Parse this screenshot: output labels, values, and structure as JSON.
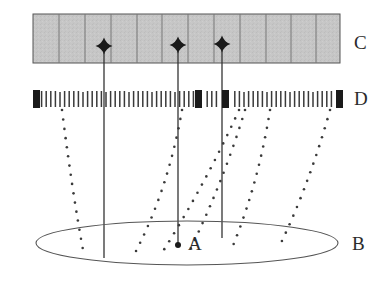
{
  "figure": {
    "background_color": "#ffffff",
    "width": 390,
    "height": 302
  },
  "labels": {
    "C": "C",
    "D": "D",
    "B": "B",
    "A": "A"
  },
  "chart_data": {
    "type": "diagram",
    "title": "",
    "xlabel": "",
    "ylabel": "",
    "elements": [
      {
        "id": "C",
        "name": "segmented-gray-bar",
        "label": "C",
        "description": "Horizontal gray segmented bar (detector / focal plane array) divided into cells by vertical rules",
        "x": 33,
        "y": 14,
        "width": 307,
        "height": 49,
        "fill_color": "#c4c4c4",
        "stroke_color": "#555555",
        "cell_count": 12,
        "cell_boundaries_x": [
          33,
          59,
          85,
          111,
          137,
          162,
          188,
          214,
          240,
          266,
          291,
          316,
          340
        ]
      },
      {
        "id": "C-stars",
        "name": "star-markers",
        "description": "Four-pointed star markers on bar C (sources imaged on the array)",
        "marker_color": "#1a1a1a",
        "points": [
          {
            "x": 104,
            "y": 46
          },
          {
            "x": 178,
            "y": 45
          },
          {
            "x": 222,
            "y": 44
          }
        ]
      },
      {
        "id": "D",
        "name": "tick-mark-row",
        "label": "D",
        "description": "Horizontal row of closely spaced thin vertical tick marks (mask / grid) with four filled dark blocks",
        "y_top": 91,
        "y_bottom": 107,
        "x_start": 33,
        "x_end": 344,
        "tick_color": "#3a3a3a",
        "tick_count": 68,
        "tick_spacing": 4.6,
        "dark_blocks": [
          {
            "x": 33,
            "width": 7
          },
          {
            "x": 195,
            "width": 7
          },
          {
            "x": 222,
            "width": 7
          },
          {
            "x": 336,
            "width": 7
          }
        ],
        "dark_block_color": "#1a1a1a"
      },
      {
        "id": "B",
        "name": "ellipse-plane",
        "label": "B",
        "description": "Large flat ellipse representing a plane or disk viewed in perspective",
        "center_x": 187,
        "center_y": 243,
        "radius_x": 151,
        "radius_y": 22,
        "stroke_color": "#555555",
        "fill": "none"
      },
      {
        "id": "A",
        "name": "center-point",
        "label": "A",
        "description": "Filled dot at the center of ellipse B where the central solid line meets the plane",
        "x": 178,
        "y": 245,
        "radius": 3,
        "color": "#1a1a1a"
      },
      {
        "id": "solid-lines",
        "name": "solid-vertical-rays",
        "description": "Three solid vertical lines from the star markers on C down to the ellipse B",
        "stroke_color": "#333333",
        "stroke_width": 1.3,
        "lines": [
          {
            "x1": 104,
            "y1": 46,
            "x2": 104,
            "y2": 258
          },
          {
            "x1": 178,
            "y1": 45,
            "x2": 178,
            "y2": 246
          },
          {
            "x1": 222,
            "y1": 44,
            "x2": 222,
            "y2": 238
          }
        ]
      },
      {
        "id": "dotted-lines",
        "name": "dotted-ray-paths",
        "description": "Dotted curved ray paths from points on the ellipse B up to the tick row D",
        "dot_color": "#3a3a3a",
        "dot_radius": 1.3,
        "dot_spacing": 9,
        "paths": [
          {
            "x1": 62,
            "y1": 110,
            "cx": 72,
            "cy": 190,
            "x2": 83,
            "y2": 250
          },
          {
            "x1": 182,
            "y1": 110,
            "cx": 168,
            "cy": 190,
            "x2": 135,
            "y2": 253
          },
          {
            "x1": 239,
            "y1": 110,
            "cx": 205,
            "cy": 185,
            "x2": 160,
            "y2": 256
          },
          {
            "x1": 245,
            "y1": 110,
            "cx": 224,
            "cy": 180,
            "x2": 190,
            "y2": 250
          },
          {
            "x1": 270,
            "y1": 110,
            "cx": 258,
            "cy": 185,
            "x2": 232,
            "y2": 248
          },
          {
            "x1": 330,
            "y1": 110,
            "cx": 310,
            "cy": 182,
            "x2": 281,
            "y2": 243
          }
        ]
      }
    ]
  }
}
